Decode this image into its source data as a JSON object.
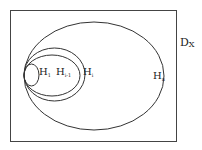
{
  "diagram": {
    "universe": {
      "label": "D",
      "subscript": "X"
    },
    "sets": [
      {
        "id": "h1",
        "label": "H",
        "subscript": "1"
      },
      {
        "id": "hi-1",
        "label": "H",
        "subscript": "i-1"
      },
      {
        "id": "hi",
        "label": "H",
        "subscript": "i"
      },
      {
        "id": "hn",
        "label": "H",
        "subscript": "n"
      }
    ],
    "stroke_color": "#333333",
    "background": "#ffffff"
  }
}
